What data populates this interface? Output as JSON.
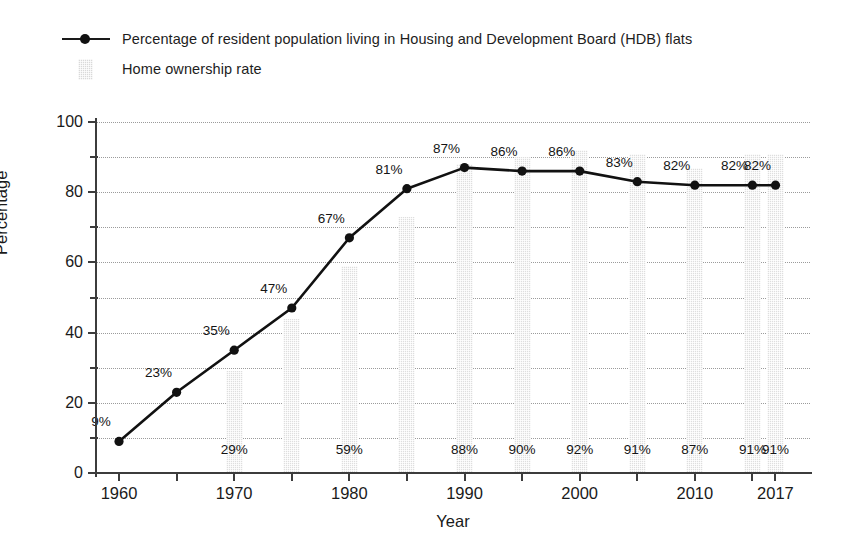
{
  "legend": {
    "items": [
      {
        "key": "line-marker",
        "label": "Percentage of resident population living in Housing and Development Board (HDB) flats"
      },
      {
        "key": "bar-swatch",
        "label": "Home ownership rate"
      }
    ]
  },
  "axes": {
    "y_title": "Percentage",
    "x_title": "Year",
    "y_major_ticks": [
      "0",
      "20",
      "40",
      "60",
      "80",
      "100"
    ],
    "x_tick_labels": [
      "1960",
      "1970",
      "1980",
      "1990",
      "2000",
      "2010",
      "2017"
    ]
  },
  "colors": {
    "line": "#111111",
    "marker": "#111111",
    "bar_fill": "#dedede",
    "grid": "#9b9b9b",
    "axis": "#3c3c3c",
    "text": "#1a1a1a",
    "background": "#ffffff"
  },
  "chart_data": {
    "type": "bar",
    "title": "",
    "xlabel": "Year",
    "ylabel": "Percentage",
    "ylim": [
      0,
      100
    ],
    "xlim": [
      1958,
      2020
    ],
    "grid": true,
    "legend_position": "top-left",
    "x": [
      1960,
      1965,
      1970,
      1975,
      1980,
      1985,
      1990,
      1995,
      2000,
      2005,
      2010,
      2015,
      2017
    ],
    "categories": [
      "1960",
      "1965",
      "1970",
      "1975",
      "1980",
      "1985",
      "1990",
      "1995",
      "2000",
      "2005",
      "2010",
      "2015",
      "2017"
    ],
    "series": [
      {
        "name": "Percentage of resident population living in Housing and Development Board (HDB) flats",
        "type": "line",
        "values": [
          9,
          23,
          35,
          47,
          67,
          81,
          87,
          86,
          86,
          83,
          82,
          82,
          82
        ],
        "labels": [
          "9%",
          "23%",
          "35%",
          "47%",
          "67%",
          "81%",
          "87%",
          "86%",
          "86%",
          "83%",
          "82%",
          "82%",
          "82%"
        ]
      },
      {
        "name": "Home ownership rate",
        "type": "bar",
        "values": [
          null,
          null,
          29,
          44,
          59,
          73,
          88,
          90,
          92,
          91,
          87,
          91,
          91
        ],
        "labels": [
          null,
          null,
          "29%",
          null,
          "59%",
          null,
          "88%",
          "90%",
          "92%",
          "91%",
          "87%",
          "91%",
          "91%"
        ]
      }
    ]
  }
}
